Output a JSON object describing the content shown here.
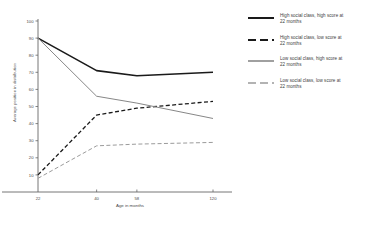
{
  "chart_data": {
    "type": "line",
    "title": "",
    "xlabel": "Age in months",
    "ylabel": "Average position in distribution",
    "x": [
      22,
      40,
      58,
      120
    ],
    "xtick_labels": [
      "22",
      "40",
      "58",
      "120"
    ],
    "ylim": [
      0,
      100
    ],
    "ytick_labels": [
      "10",
      "20",
      "30",
      "40",
      "50",
      "60",
      "70",
      "80",
      "90",
      "100"
    ],
    "ytick_values": [
      10,
      20,
      30,
      40,
      50,
      60,
      70,
      80,
      90,
      100
    ],
    "grid": false,
    "legend_position": "right",
    "series": [
      {
        "name": "High social class, high score at 22 months",
        "style": "solid",
        "color": "#1a1a1a",
        "width": 1.6,
        "values": [
          90,
          71,
          68,
          70
        ]
      },
      {
        "name": "High social class, low score at 22 months",
        "style": "dashed",
        "color": "#1a1a1a",
        "width": 1.3,
        "values": [
          10,
          45,
          49,
          53
        ]
      },
      {
        "name": "Low social class, high score at 22 months",
        "style": "solid",
        "color": "#878787",
        "width": 1.0,
        "values": [
          90,
          56,
          52,
          43
        ]
      },
      {
        "name": "Low social class, low score at 22 months",
        "style": "dashed",
        "color": "#9b9b9b",
        "width": 1.0,
        "values": [
          8,
          27,
          28,
          29
        ]
      }
    ]
  },
  "legend": {
    "items": [
      {
        "label": "High social class, high score at\n22 months",
        "style": "solid",
        "color": "#1a1a1a",
        "width": 2.0
      },
      {
        "label": "High social class, low score at\n22 months",
        "style": "dashed",
        "color": "#1a1a1a",
        "width": 2.0
      },
      {
        "label": "Low social class, high score at\n22 months",
        "style": "solid",
        "color": "#6d6d6d",
        "width": 1.3
      },
      {
        "label": "Low social class, low score at\n22 months",
        "style": "dashed",
        "color": "#9b9b9b",
        "width": 1.3
      }
    ]
  },
  "axes": {
    "x_title": "Age in months",
    "y_title": "Average position in distribution"
  }
}
